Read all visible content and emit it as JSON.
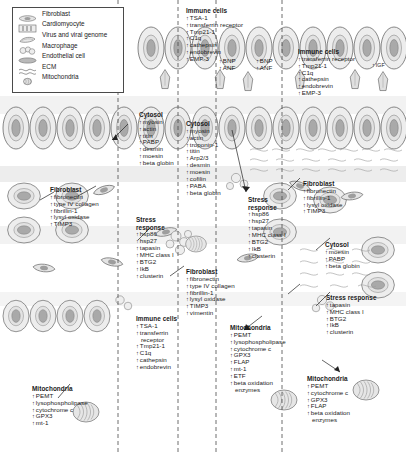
{
  "figure": {
    "type": "biological-schematic",
    "panels": 4
  },
  "legend": {
    "items": [
      {
        "label": "Fibroblast",
        "icon": "fibroblast-icon"
      },
      {
        "label": "Cardiomyocyte",
        "icon": "cardiomyocyte-icon"
      },
      {
        "label": "Virus and viral genome",
        "icon": "virus-icon"
      },
      {
        "label": "Macrophage",
        "icon": "macrophage-icon"
      },
      {
        "label": "Endothelial cell",
        "icon": "endothelial-cell-icon"
      },
      {
        "label": "ECM",
        "icon": "ecm-icon"
      },
      {
        "label": "Mitochondria",
        "icon": "mitochondria-icon"
      }
    ]
  },
  "blocks": {
    "immune_top_mid": {
      "header": "Immune cells",
      "items": [
        "TSA-1",
        "transferrin receptor",
        "Tmp21-1",
        "C1q",
        "cathepsin",
        "endobrevin",
        "EMP-3"
      ]
    },
    "natriuretic_left": {
      "items": [
        "BNP",
        "ANF"
      ]
    },
    "natriuretic_right": {
      "items": [
        "BNP",
        "ANF"
      ]
    },
    "immune_top_right": {
      "header": "Immune cells",
      "items": [
        "transferrin receptor",
        "Tmp21-1",
        "C1q",
        "cathepsin",
        "endobrevin",
        "EMP-3"
      ]
    },
    "igf_marker": {
      "items": [
        "IGF"
      ]
    },
    "cytosol_left": {
      "header": "Cytosol",
      "items": [
        "myosin",
        "actin",
        "titin",
        "PABP",
        "desmin",
        "moesin",
        "beta globin"
      ]
    },
    "cytosol_mid": {
      "header": "Cytosol",
      "items": [
        "myosin",
        "actin",
        "troponin-1",
        "titin",
        "Arp2/3",
        "desmin",
        "moesin",
        "cofilin",
        "PABA",
        "beta globin"
      ]
    },
    "cytosol_right": {
      "header": "Cytosol",
      "items": [
        "moesin",
        "PABP",
        "beta globin"
      ]
    },
    "fibroblast_left": {
      "header": "Fibroblast",
      "items": [
        "fibronectin",
        "type IV collagen",
        "fibrillin-1",
        "lysyl oxidase",
        "TIMP3"
      ]
    },
    "fibroblast_mid": {
      "header": "Fibroblast",
      "items": [
        "fibronectin",
        "type IV collagen",
        "fibrillin-1",
        "lysyl oxidase",
        "TIMP3",
        "vimentin"
      ]
    },
    "fibroblast_right": {
      "header": "Fibroblast",
      "items": [
        "fibronectin",
        "fibrillin-1",
        "lysyl oxidase",
        "TIMP3"
      ]
    },
    "stress_left": {
      "header_line1": "Stress",
      "header_line2": "response",
      "items": [
        "hsp86",
        "hsp27",
        "tapasin",
        "MHC class I",
        "BTG2",
        "IkB",
        "clusterin"
      ]
    },
    "stress_mid": {
      "header_line1": "Stress",
      "header_line2": "response",
      "items": [
        "hsp86",
        "hsp27",
        "tapasin",
        "MHC class I",
        "BTG2",
        "IkB",
        "clusterin"
      ]
    },
    "stress_right": {
      "header_line1": "Stress response",
      "header_line2": "",
      "items": [
        "tapasin",
        "MHC class I",
        "BTG2",
        "IkB",
        "clusterin"
      ]
    },
    "immune_mid_low": {
      "header": "Immune cells",
      "items": [
        "TSA-1",
        "transferrin",
        "receptor",
        "Tmp21-1",
        "C1q",
        "cathepsin",
        "endobrevin"
      ]
    },
    "mito_left": {
      "header": "Mitochondria",
      "items": [
        "PEMT",
        "lysophospholipase",
        "cytochrome c",
        "GPX3",
        "mt-1"
      ]
    },
    "mito_mid": {
      "header": "Mitochondria",
      "items": [
        "PEMT",
        "lysophospholipase",
        "cytochrome c",
        "GPX3",
        "FLAP",
        "mt-1",
        "ETF",
        "beta oxidation",
        "enzymes"
      ]
    },
    "mito_right": {
      "header": "Mitochondria",
      "items": [
        "PEMT",
        "cytochrome c",
        "GPX3",
        "FLAP",
        "beta oxidation",
        "enzymes"
      ]
    }
  },
  "colors": {
    "cell_fill": "#e8e8e8",
    "nucleus": "#a8a8a8",
    "outline": "#555555",
    "band": "#d6d6d6",
    "text": "#1a1a1a"
  }
}
